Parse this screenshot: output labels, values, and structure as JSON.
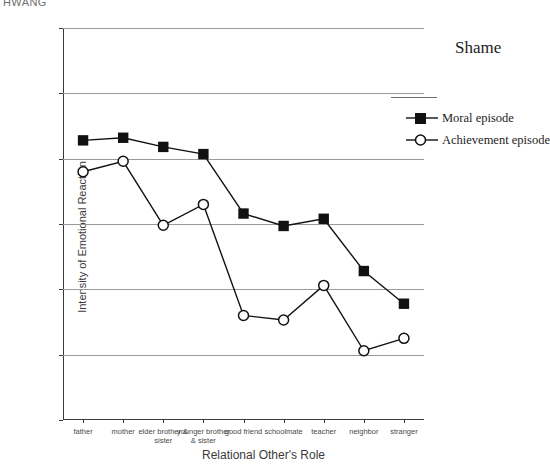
{
  "running_head": "HWANG",
  "chart_data": {
    "type": "line",
    "title": "Shame",
    "xlabel": "Relational Other's Role",
    "ylabel": "Intensity of Emotional Reaction",
    "ylim": [
      0,
      6
    ],
    "yticks": [
      0,
      1,
      2,
      3,
      4,
      5,
      6
    ],
    "ytick_labels": [
      "0",
      "1",
      "2",
      "3",
      "4",
      "5",
      "6"
    ],
    "grid": "horizontal",
    "legend_position": "upper-right",
    "categories": [
      "father",
      "mother",
      "elder brother & sister",
      "younger brother & sister",
      "good friend",
      "schoolmate",
      "teacher",
      "neighbor",
      "stranger"
    ],
    "series": [
      {
        "name": "Moral episode",
        "marker": "filled-square",
        "values": [
          4.28,
          4.32,
          4.18,
          4.07,
          3.16,
          2.97,
          3.08,
          2.28,
          1.78
        ]
      },
      {
        "name": "Achievement episode",
        "marker": "open-circle",
        "values": [
          3.8,
          3.96,
          2.98,
          3.3,
          1.6,
          1.53,
          2.06,
          1.06,
          1.25
        ]
      }
    ],
    "colors": {
      "line": "#111111",
      "gridline": "#9a9a9a",
      "axis": "#3a3a3a",
      "text": "#2b2b2b"
    }
  }
}
